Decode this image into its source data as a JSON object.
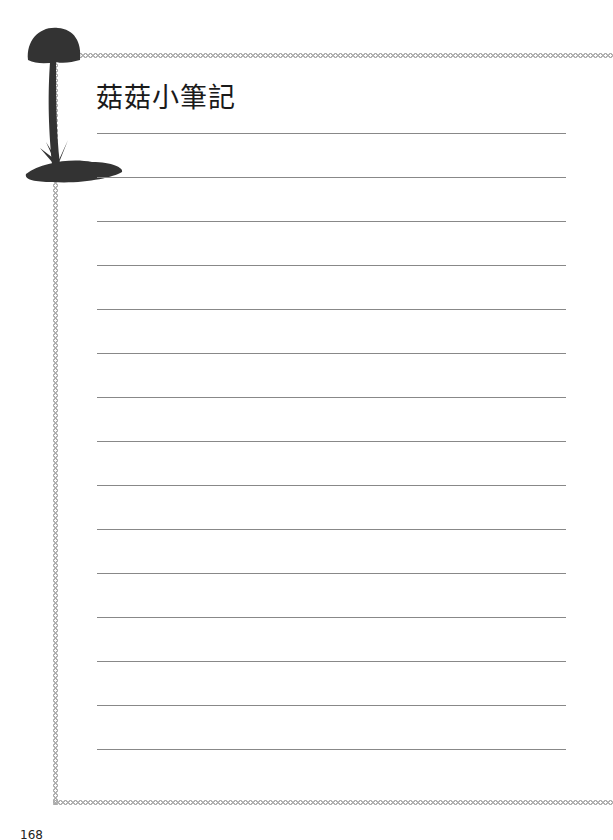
{
  "page": {
    "title": "菇菇小筆記",
    "page_number": "168",
    "line_count": 15,
    "colors": {
      "line": "#888888",
      "border": "#aaaaaa",
      "mushroom": "#333333"
    }
  },
  "decoration": {
    "icon": "mushroom-silhouette-icon"
  }
}
